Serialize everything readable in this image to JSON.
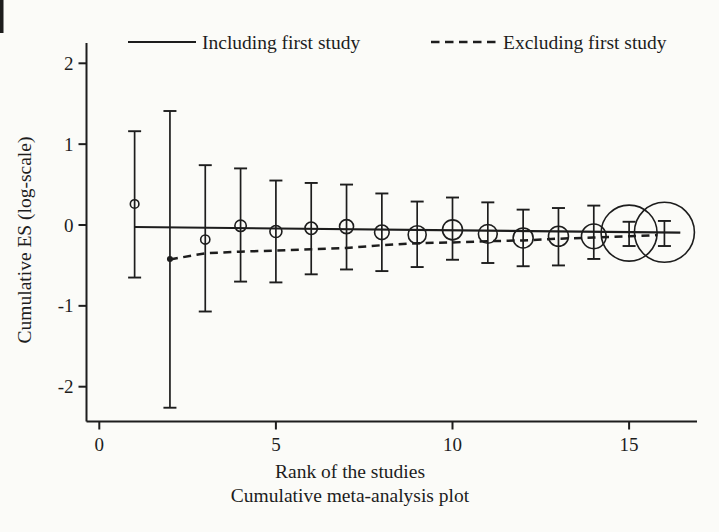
{
  "figure": {
    "background": "#fbfbf8",
    "ink": "#1d1d1d"
  },
  "legend": {
    "including_label": "Including first study",
    "excluding_label": "Excluding first study"
  },
  "chart_data": {
    "type": "scatter",
    "title": "",
    "xlabel": "Rank of the studies",
    "caption": "Cumulative meta-analysis plot",
    "ylabel": "Cumulative ES (log-scale)",
    "legend": [
      "Including first study",
      "Excluding first study"
    ],
    "legend_position": "top",
    "grid": false,
    "xlim": [
      0,
      17
    ],
    "ylim": [
      -2.45,
      2.25
    ],
    "x_ticks": [
      0,
      5,
      10,
      15
    ],
    "x_tick_labels": [
      "0",
      "5",
      "10",
      "15"
    ],
    "y_ticks": [
      2,
      1,
      0,
      -1,
      -2
    ],
    "y_tick_labels": [
      "2",
      "1",
      "0",
      "-1",
      "-2"
    ],
    "studies": [
      {
        "rank": 1,
        "es": 0.26,
        "ci_low": -0.65,
        "ci_high": 1.16,
        "marker": "open-circle",
        "radius_px": 4.3
      },
      {
        "rank": 2,
        "es": -0.42,
        "ci_low": -2.26,
        "ci_high": 1.41,
        "marker": "filled-dot",
        "radius_px": 3.0
      },
      {
        "rank": 3,
        "es": -0.18,
        "ci_low": -1.07,
        "ci_high": 0.74,
        "marker": "open-circle",
        "radius_px": 4.6
      },
      {
        "rank": 4,
        "es": -0.01,
        "ci_low": -0.7,
        "ci_high": 0.7,
        "marker": "open-circle",
        "radius_px": 5.7
      },
      {
        "rank": 5,
        "es": -0.08,
        "ci_low": -0.71,
        "ci_high": 0.55,
        "marker": "open-circle",
        "radius_px": 6.0
      },
      {
        "rank": 6,
        "es": -0.04,
        "ci_low": -0.61,
        "ci_high": 0.52,
        "marker": "open-circle",
        "radius_px": 6.2
      },
      {
        "rank": 7,
        "es": -0.02,
        "ci_low": -0.55,
        "ci_high": 0.5,
        "marker": "open-circle",
        "radius_px": 7.0
      },
      {
        "rank": 8,
        "es": -0.09,
        "ci_low": -0.57,
        "ci_high": 0.39,
        "marker": "open-circle",
        "radius_px": 7.3
      },
      {
        "rank": 9,
        "es": -0.12,
        "ci_low": -0.52,
        "ci_high": 0.29,
        "marker": "open-circle",
        "radius_px": 9.0
      },
      {
        "rank": 10,
        "es": -0.06,
        "ci_low": -0.43,
        "ci_high": 0.34,
        "marker": "open-circle",
        "radius_px": 10.0
      },
      {
        "rank": 11,
        "es": -0.11,
        "ci_low": -0.47,
        "ci_high": 0.28,
        "marker": "open-circle",
        "radius_px": 9.4
      },
      {
        "rank": 12,
        "es": -0.16,
        "ci_low": -0.51,
        "ci_high": 0.19,
        "marker": "open-circle",
        "radius_px": 10.0
      },
      {
        "rank": 13,
        "es": -0.14,
        "ci_low": -0.5,
        "ci_high": 0.21,
        "marker": "open-circle",
        "radius_px": 10.0
      },
      {
        "rank": 14,
        "es": -0.14,
        "ci_low": -0.42,
        "ci_high": 0.24,
        "marker": "open-circle",
        "radius_px": 12.3
      },
      {
        "rank": 15,
        "es": -0.1,
        "ci_low": -0.26,
        "ci_high": 0.04,
        "marker": "open-circle",
        "radius_px": 28.0
      },
      {
        "rank": 16,
        "es": -0.09,
        "ci_low": -0.26,
        "ci_high": 0.05,
        "marker": "open-circle",
        "radius_px": 30.0
      }
    ],
    "series": [
      {
        "name": "Including first study",
        "style": "solid",
        "points": [
          {
            "x": 1.0,
            "y": -0.025
          },
          {
            "x": 16.45,
            "y": -0.095
          }
        ]
      },
      {
        "name": "Excluding first study",
        "style": "dashed",
        "points": [
          {
            "x": 2,
            "y": -0.425
          },
          {
            "x": 3,
            "y": -0.35
          },
          {
            "x": 4,
            "y": -0.33
          },
          {
            "x": 5,
            "y": -0.315
          },
          {
            "x": 6,
            "y": -0.3
          },
          {
            "x": 7,
            "y": -0.285
          },
          {
            "x": 8,
            "y": -0.25
          },
          {
            "x": 9,
            "y": -0.225
          },
          {
            "x": 10,
            "y": -0.215
          },
          {
            "x": 11,
            "y": -0.2
          },
          {
            "x": 12,
            "y": -0.19
          },
          {
            "x": 13,
            "y": -0.17
          },
          {
            "x": 14,
            "y": -0.155
          },
          {
            "x": 15,
            "y": -0.14
          },
          {
            "x": 15.8,
            "y": -0.125
          }
        ]
      }
    ]
  }
}
